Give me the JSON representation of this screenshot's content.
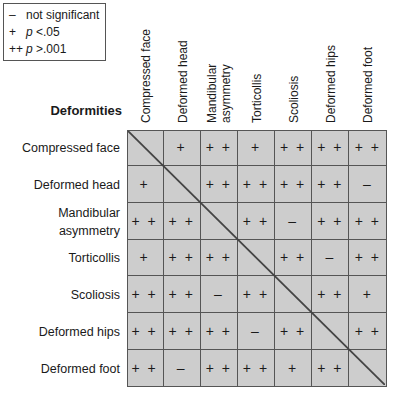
{
  "legend": [
    {
      "symbol": "–",
      "pre": "",
      "italic": "",
      "text": "not significant"
    },
    {
      "symbol": "+",
      "pre": "",
      "italic": "p",
      "text": " <.05"
    },
    {
      "symbol": "++",
      "pre": "",
      "italic": "p",
      "text": " >.001"
    }
  ],
  "heading": "Deformities",
  "columns": [
    "Compressed face",
    "Deformed head",
    "Mandibular asymmetry",
    "Torticollis",
    "Scoliosis",
    "Deformed hips",
    "Deformed foot"
  ],
  "column_lines": [
    [
      "Compressed face"
    ],
    [
      "Deformed head"
    ],
    [
      "Mandibular",
      "asymmetry"
    ],
    [
      "Torticollis"
    ],
    [
      "Scoliosis"
    ],
    [
      "Deformed hips"
    ],
    [
      "Deformed foot"
    ]
  ],
  "rows": [
    {
      "label": [
        "Compressed face"
      ],
      "cells": [
        "",
        "+",
        "+ +",
        "+",
        "+ +",
        "+ +",
        "+ +"
      ]
    },
    {
      "label": [
        "Deformed head"
      ],
      "cells": [
        "+",
        "",
        "+ +",
        "+ +",
        "+ +",
        "+ +",
        "–"
      ]
    },
    {
      "label": [
        "Mandibular",
        "asymmetry"
      ],
      "cells": [
        "+ +",
        "+ +",
        "",
        "+ +",
        "–",
        "+ +",
        "+ +"
      ]
    },
    {
      "label": [
        "Torticollis"
      ],
      "cells": [
        "+",
        "+ +",
        "+ +",
        "",
        "+ +",
        "–",
        "+ +"
      ]
    },
    {
      "label": [
        "Scoliosis"
      ],
      "cells": [
        "+ +",
        "+ +",
        "–",
        "+ +",
        "",
        "+ +",
        "+"
      ]
    },
    {
      "label": [
        "Deformed hips"
      ],
      "cells": [
        "+ +",
        "+ +",
        "+ +",
        "–",
        "+ +",
        "",
        "+ +"
      ]
    },
    {
      "label": [
        "Deformed foot"
      ],
      "cells": [
        "+ +",
        "–",
        "+ +",
        "+ +",
        "+",
        "+ +",
        ""
      ]
    }
  ],
  "colors": {
    "cell_fill": "#cdcdcd",
    "grid_line": "#555555",
    "diagonal": "#444444"
  }
}
